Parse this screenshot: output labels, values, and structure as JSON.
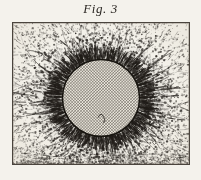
{
  "plate": {
    "caption": "Fig. 3",
    "background_color": "#f4f2ec",
    "ink_color": "#201c18",
    "frame_color": "#4a443d",
    "width": 201,
    "height": 180
  },
  "frame": {
    "x": 12,
    "y": 22,
    "width": 178,
    "height": 143,
    "border_width": 1.3
  },
  "figure": {
    "technique": "line engraving with stipple",
    "magnet": {
      "shape": "circle",
      "center_x": 89,
      "center_y": 76,
      "radius": 39,
      "fill": "cross-hatch",
      "hatch_spacing": 2.1,
      "hatch_color": "#3a342c",
      "outline_color": "#17140f",
      "outline_width": 1.6
    },
    "field": {
      "ray_count": 150,
      "ray_inner_offset": 1,
      "ray_max_length": 86,
      "ray_min_length": 26,
      "segments_per_ray": 9,
      "curvature": 0.42,
      "dash_min": 1.1,
      "dash_max": 3.4,
      "dense_belt_note": "heaviest accumulation in a ring just outside the magnet rim",
      "polar_thinning_note": "streaks thin and scatter toward the frame corners"
    },
    "stipple": {
      "count": 5200,
      "dot_min": 0.35,
      "dot_max": 1.15,
      "opacity_min": 0.22,
      "opacity_max": 0.92
    },
    "plate_wear": {
      "bottom_smudge": true,
      "corner_fade": true
    }
  },
  "icons": {
    "magnet_disc": "hatched-disc-icon",
    "field_lines": "radial-field-icon"
  }
}
